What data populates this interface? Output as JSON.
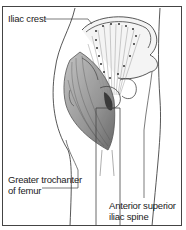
{
  "diagram": {
    "labels": {
      "iliac_crest": "Iliac crest",
      "greater_trochanter_line1": "Greater trochanter",
      "greater_trochanter_line2": "of femur",
      "anterior_superior_line1": "Anterior superior",
      "anterior_superior_line2": "iliac spine"
    },
    "colors": {
      "line": "#444444",
      "muscle_shade": "#8a8a8a",
      "dark_shade": "#3a3a3a",
      "background": "#ffffff"
    }
  }
}
